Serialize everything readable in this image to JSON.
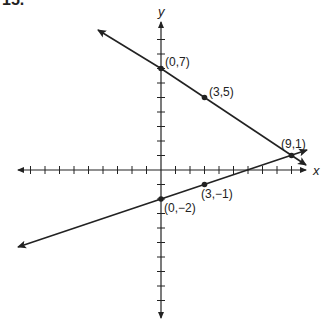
{
  "problem_number": "15.",
  "axes": {
    "x_label": "x",
    "y_label": "y",
    "x_range": [
      -10,
      10
    ],
    "y_range": [
      -10,
      10
    ],
    "tick_step": 1
  },
  "lines": [
    {
      "name": "line-1",
      "points": [
        [
          0,
          7
        ],
        [
          3,
          5
        ],
        [
          9,
          1
        ]
      ],
      "slope": "-2/3",
      "intercept": 7
    },
    {
      "name": "line-2",
      "points": [
        [
          0,
          -2
        ],
        [
          3,
          -1
        ],
        [
          9,
          1
        ]
      ],
      "slope": "1/3",
      "intercept": -2
    }
  ],
  "point_labels": {
    "p0_7": "(0,7)",
    "p3_5": "(3,5)",
    "p9_1": "(9,1)",
    "p0_m2": "(0,−2)",
    "p3_m1": "(3,−1)"
  },
  "colors": {
    "ink": "#222222",
    "background": "#ffffff"
  }
}
